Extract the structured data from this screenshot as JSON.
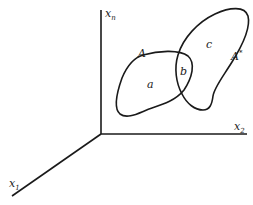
{
  "diagram": {
    "type": "set-overlap-in-feature-space",
    "axes": {
      "vertical": {
        "label_base": "x",
        "label_sub": "n"
      },
      "horizontal": {
        "label_base": "x",
        "label_sub": "2"
      },
      "depth": {
        "label_base": "x",
        "label_sub": "1"
      }
    },
    "sets": [
      {
        "id": "A",
        "label": "A"
      },
      {
        "id": "A_star",
        "label": "A*",
        "label_base": "A",
        "label_sup": "*"
      }
    ],
    "regions": [
      {
        "id": "a",
        "label": "a",
        "description": "A only"
      },
      {
        "id": "b",
        "label": "b",
        "description": "A and A* intersection"
      },
      {
        "id": "c",
        "label": "c",
        "description": "A* only"
      }
    ],
    "colors": {
      "ink": "#1a1a1a",
      "background": "#ffffff"
    }
  }
}
